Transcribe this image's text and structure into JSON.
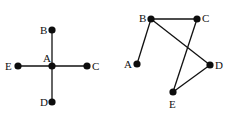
{
  "colors": {
    "edge": "#111111",
    "node": "#0d0d0d",
    "background": "#ffffff"
  },
  "graphs": [
    {
      "name": "star-graph",
      "nodes": [
        {
          "id": "A",
          "label": "A",
          "x": 52,
          "y": 66,
          "lx": 43,
          "ly": 62
        },
        {
          "id": "B",
          "label": "B",
          "x": 52,
          "y": 30,
          "lx": 40,
          "ly": 34
        },
        {
          "id": "C",
          "label": "C",
          "x": 87,
          "y": 66,
          "lx": 92,
          "ly": 70
        },
        {
          "id": "D",
          "label": "D",
          "x": 52,
          "y": 102,
          "lx": 40,
          "ly": 106
        },
        {
          "id": "E",
          "label": "E",
          "x": 18,
          "y": 66,
          "lx": 5,
          "ly": 70
        }
      ],
      "edges": [
        [
          "A",
          "B"
        ],
        [
          "A",
          "C"
        ],
        [
          "A",
          "D"
        ],
        [
          "A",
          "E"
        ]
      ]
    },
    {
      "name": "path-graph",
      "nodes": [
        {
          "id": "A",
          "label": "A",
          "x": 137,
          "y": 64,
          "lx": 124,
          "ly": 68
        },
        {
          "id": "B",
          "label": "B",
          "x": 151,
          "y": 19,
          "lx": 139,
          "ly": 22
        },
        {
          "id": "C",
          "label": "C",
          "x": 197,
          "y": 19,
          "lx": 202,
          "ly": 22
        },
        {
          "id": "D",
          "label": "D",
          "x": 210,
          "y": 65,
          "lx": 215,
          "ly": 69
        },
        {
          "id": "E",
          "label": "E",
          "x": 173,
          "y": 92,
          "lx": 169,
          "ly": 108
        }
      ],
      "edges": [
        [
          "B",
          "A"
        ],
        [
          "B",
          "C"
        ],
        [
          "B",
          "D"
        ],
        [
          "C",
          "E"
        ],
        [
          "D",
          "E"
        ]
      ]
    }
  ]
}
